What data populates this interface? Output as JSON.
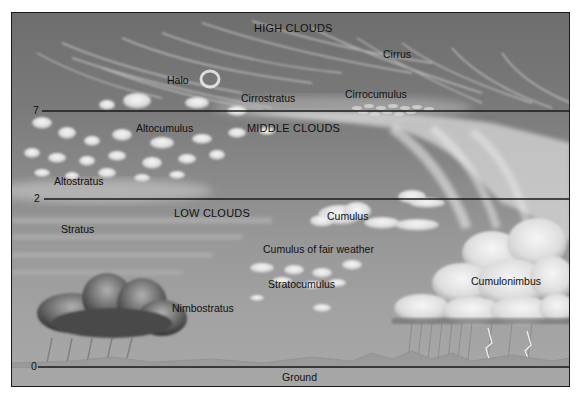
{
  "diagram": {
    "axis": {
      "label": "Height (km)",
      "ticks": [
        {
          "value": "7",
          "y": 110
        },
        {
          "value": "2",
          "y": 199
        },
        {
          "value": "0",
          "y": 366
        }
      ]
    },
    "zones": {
      "high": "HIGH CLOUDS",
      "middle": "MIDDLE CLOUDS",
      "low": "LOW CLOUDS",
      "ground": "Ground"
    },
    "clouds": {
      "cirrus": "Cirrus",
      "halo": "Halo",
      "cirrostratus": "Cirrostratus",
      "cirrocumulus": "Cirrocumulus",
      "altocumulus": "Altocumulus",
      "altostratus": "Altostratus",
      "stratus": "Stratus",
      "cumulus": "Cumulus",
      "cumulus_fair": "Cumulus of fair weather",
      "stratocumulus": "Stratocumulus",
      "nimbostratus": "Nimbostratus",
      "cumulonimbus": "Cumulonimbus"
    },
    "colors": {
      "sky_top": "#6e6e6e",
      "sky_bottom": "#a8a8a8",
      "cloud": "#eeeeee",
      "line": "#1a1a1a"
    }
  }
}
